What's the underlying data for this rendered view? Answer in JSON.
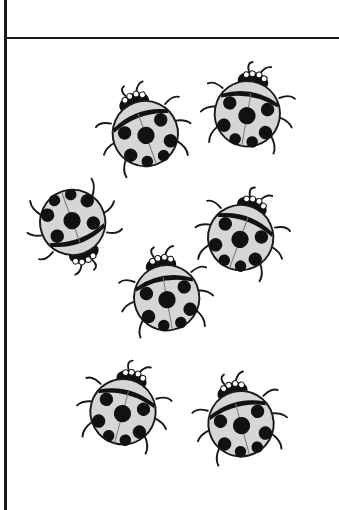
{
  "worksheet": {
    "colors": {
      "line": "#1a1a1a",
      "shell": "#d6d6d6",
      "spot": "#111111",
      "background": "#ffffff"
    },
    "ladybug_count": 7,
    "ladybugs": [
      {
        "id": 1,
        "x": 96,
        "y": 82,
        "rotation": -20
      },
      {
        "id": 2,
        "x": 200,
        "y": 62,
        "rotation": 10
      },
      {
        "id": 3,
        "x": 26,
        "y": 178,
        "rotation": 160
      },
      {
        "id": 4,
        "x": 194,
        "y": 186,
        "rotation": 20
      },
      {
        "id": 5,
        "x": 118,
        "y": 246,
        "rotation": -10
      },
      {
        "id": 6,
        "x": 76,
        "y": 360,
        "rotation": 15
      },
      {
        "id": 7,
        "x": 192,
        "y": 372,
        "rotation": -15
      }
    ]
  }
}
